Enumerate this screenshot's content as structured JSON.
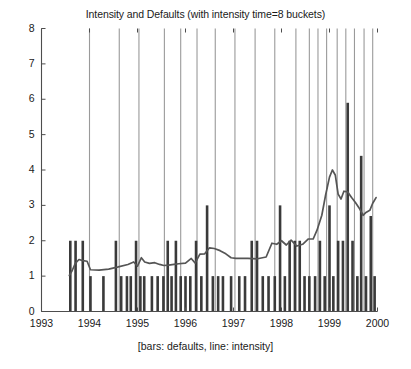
{
  "chart_data": {
    "type": "bar",
    "title": "Intensity and Defaults (with intensity time=8 buckets)",
    "caption": "[bars: defaults, line: intensity]",
    "xlabel": "",
    "ylabel": "",
    "xlim": [
      1993,
      2000
    ],
    "ylim": [
      0,
      8
    ],
    "grid": false,
    "legend_position": "below-axis-as-caption",
    "y_ticks": [
      0,
      1,
      2,
      3,
      4,
      5,
      6,
      7,
      8
    ],
    "y_tick_labels": [
      "0",
      "1",
      "2",
      "3",
      "4",
      "5",
      "6",
      "7",
      "8"
    ],
    "x_ticks": [
      1993,
      1994,
      1995,
      1996,
      1997,
      1998,
      1999,
      2000
    ],
    "x_tick_labels": [
      "1993",
      "1994",
      "1995",
      "1996",
      "1997",
      "1998",
      "1999",
      "2000"
    ],
    "colors": {
      "bars": "#3a3a3a",
      "line": "#555555",
      "bucket_lines": "#9a9a9a",
      "axis": "#4d4d4d",
      "background": "#ffffff"
    },
    "series": [
      {
        "name": "defaults",
        "type": "bar",
        "color": "#3a3a3a",
        "points": [
          [
            1993.6,
            2.0
          ],
          [
            1993.71,
            2.0
          ],
          [
            1993.86,
            2.0
          ],
          [
            1994.02,
            1.0
          ],
          [
            1994.29,
            1.0
          ],
          [
            1994.55,
            2.0
          ],
          [
            1994.66,
            1.0
          ],
          [
            1994.78,
            1.0
          ],
          [
            1994.86,
            1.0
          ],
          [
            1994.97,
            2.0
          ],
          [
            1995.06,
            1.0
          ],
          [
            1995.14,
            1.0
          ],
          [
            1995.3,
            1.0
          ],
          [
            1995.42,
            1.0
          ],
          [
            1995.54,
            1.0
          ],
          [
            1995.63,
            2.0
          ],
          [
            1995.71,
            1.0
          ],
          [
            1995.8,
            2.0
          ],
          [
            1995.9,
            1.0
          ],
          [
            1996.0,
            1.0
          ],
          [
            1996.1,
            1.0
          ],
          [
            1996.22,
            2.0
          ],
          [
            1996.33,
            1.0
          ],
          [
            1996.45,
            3.0
          ],
          [
            1996.57,
            1.0
          ],
          [
            1996.68,
            1.0
          ],
          [
            1996.78,
            1.0
          ],
          [
            1996.95,
            1.0
          ],
          [
            1997.12,
            1.0
          ],
          [
            1997.24,
            1.0
          ],
          [
            1997.38,
            2.0
          ],
          [
            1997.49,
            2.0
          ],
          [
            1997.61,
            1.0
          ],
          [
            1997.73,
            1.0
          ],
          [
            1997.86,
            1.0
          ],
          [
            1997.97,
            3.0
          ],
          [
            1998.07,
            1.0
          ],
          [
            1998.17,
            2.0
          ],
          [
            1998.28,
            2.0
          ],
          [
            1998.38,
            2.0
          ],
          [
            1998.48,
            1.0
          ],
          [
            1998.58,
            1.0
          ],
          [
            1998.7,
            1.0
          ],
          [
            1998.8,
            2.0
          ],
          [
            1998.9,
            1.0
          ],
          [
            1999.0,
            3.0
          ],
          [
            1999.08,
            1.0
          ],
          [
            1999.18,
            2.0
          ],
          [
            1999.28,
            2.0
          ],
          [
            1999.38,
            5.9
          ],
          [
            1999.48,
            2.0
          ],
          [
            1999.58,
            1.0
          ],
          [
            1999.66,
            4.4
          ],
          [
            1999.76,
            1.0
          ],
          [
            1999.86,
            2.7
          ],
          [
            1999.94,
            1.0
          ]
        ]
      },
      {
        "name": "intensity",
        "type": "line",
        "color": "#555555",
        "points": [
          [
            1993.58,
            1.02
          ],
          [
            1993.64,
            1.16
          ],
          [
            1993.7,
            1.35
          ],
          [
            1993.78,
            1.47
          ],
          [
            1993.86,
            1.44
          ],
          [
            1993.95,
            1.42
          ],
          [
            1994.02,
            1.18
          ],
          [
            1994.2,
            1.17
          ],
          [
            1994.4,
            1.2
          ],
          [
            1994.6,
            1.26
          ],
          [
            1994.8,
            1.33
          ],
          [
            1994.92,
            1.4
          ],
          [
            1995.0,
            1.28
          ],
          [
            1995.08,
            1.52
          ],
          [
            1995.15,
            1.4
          ],
          [
            1995.25,
            1.36
          ],
          [
            1995.36,
            1.38
          ],
          [
            1995.46,
            1.33
          ],
          [
            1995.55,
            1.3
          ],
          [
            1995.65,
            1.31
          ],
          [
            1995.76,
            1.33
          ],
          [
            1995.86,
            1.35
          ],
          [
            1996.0,
            1.37
          ],
          [
            1996.12,
            1.5
          ],
          [
            1996.2,
            1.37
          ],
          [
            1996.3,
            1.62
          ],
          [
            1996.4,
            1.63
          ],
          [
            1996.5,
            1.8
          ],
          [
            1996.6,
            1.78
          ],
          [
            1996.72,
            1.72
          ],
          [
            1996.84,
            1.63
          ],
          [
            1996.95,
            1.52
          ],
          [
            1997.05,
            1.5
          ],
          [
            1997.3,
            1.5
          ],
          [
            1997.5,
            1.49
          ],
          [
            1997.68,
            1.54
          ],
          [
            1997.8,
            1.93
          ],
          [
            1997.9,
            1.9
          ],
          [
            1998.0,
            2.0
          ],
          [
            1998.1,
            1.88
          ],
          [
            1998.2,
            2.02
          ],
          [
            1998.32,
            1.85
          ],
          [
            1998.44,
            1.9
          ],
          [
            1998.56,
            2.05
          ],
          [
            1998.66,
            2.05
          ],
          [
            1998.74,
            2.3
          ],
          [
            1998.84,
            2.72
          ],
          [
            1998.92,
            3.3
          ],
          [
            1999.0,
            3.8
          ],
          [
            1999.06,
            4.0
          ],
          [
            1999.12,
            3.86
          ],
          [
            1999.18,
            3.32
          ],
          [
            1999.24,
            3.18
          ],
          [
            1999.3,
            3.4
          ],
          [
            1999.38,
            3.38
          ],
          [
            1999.46,
            3.22
          ],
          [
            1999.54,
            3.08
          ],
          [
            1999.62,
            2.92
          ],
          [
            1999.7,
            2.72
          ],
          [
            1999.76,
            2.8
          ],
          [
            1999.84,
            2.86
          ],
          [
            1999.9,
            3.06
          ],
          [
            1999.97,
            3.22
          ]
        ]
      }
    ],
    "bucket_lines": {
      "name": "intensity-time-bucket-boundaries",
      "color": "#9a9a9a",
      "x_values": [
        1994.0,
        1994.62,
        1995.03,
        1995.56,
        1995.9,
        1996.24,
        1996.62,
        1997.03,
        1997.45,
        1997.86,
        1998.3,
        1998.58,
        1998.76,
        1998.94,
        1999.16,
        1999.34,
        1999.52,
        1999.72,
        1999.9
      ]
    }
  }
}
